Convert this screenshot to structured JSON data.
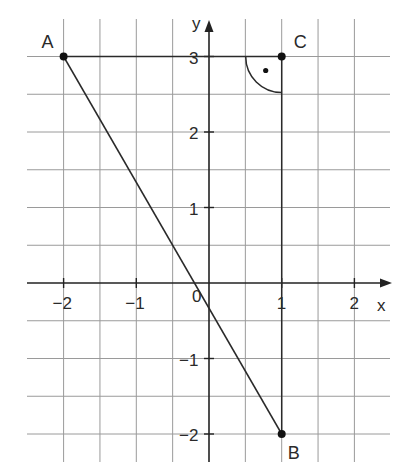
{
  "diagram": {
    "type": "coordinate-grid-triangle",
    "axes": {
      "x_label": "x",
      "y_label": "y",
      "origin_label": "0",
      "x_ticks": [
        {
          "value": -2,
          "label": "−2"
        },
        {
          "value": -1,
          "label": "−1"
        },
        {
          "value": 1,
          "label": "1"
        },
        {
          "value": 2,
          "label": "2"
        }
      ],
      "y_ticks": [
        {
          "value": 3,
          "label": "3"
        },
        {
          "value": 2,
          "label": "2"
        },
        {
          "value": 1,
          "label": "1"
        },
        {
          "value": -1,
          "label": "−1"
        },
        {
          "value": -2,
          "label": "−2"
        }
      ],
      "x_range": [
        -2.5,
        2.5
      ],
      "y_range": [
        -2.4,
        3.5
      ],
      "grid_step": 0.5
    },
    "points": [
      {
        "name": "A",
        "x": -2,
        "y": 3
      },
      {
        "name": "B",
        "x": 1,
        "y": -2
      },
      {
        "name": "C",
        "x": 1,
        "y": 3
      }
    ],
    "segments": [
      {
        "from": "A",
        "to": "C"
      },
      {
        "from": "C",
        "to": "B"
      },
      {
        "from": "A",
        "to": "B"
      }
    ],
    "right_angle_at": "C",
    "colors": {
      "grid": "#9a9a9a",
      "axis": "#222222",
      "line": "#2a2a2a",
      "point": "#111111",
      "text": "#2a2a2a"
    }
  }
}
